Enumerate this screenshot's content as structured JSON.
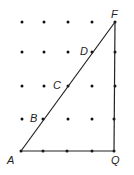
{
  "diagram": {
    "type": "dot-grid-triangle",
    "grid": {
      "columns": 5,
      "rows": 5
    },
    "points": {
      "A": {
        "label": "A",
        "col": 0,
        "row": 0
      },
      "B": {
        "label": "B",
        "col": 1,
        "row": 1
      },
      "C": {
        "label": "C",
        "col": 2,
        "row": 2
      },
      "D": {
        "label": "D",
        "col": 3,
        "row": 3
      },
      "F": {
        "label": "F",
        "col": 4,
        "row": 4
      },
      "Q": {
        "label": "Q",
        "col": 4,
        "row": 0
      }
    },
    "segments": [
      "AF",
      "FQ",
      "QA"
    ],
    "colors": {
      "line": "#222222",
      "dot": "#111111",
      "background": "#ffffff"
    }
  }
}
